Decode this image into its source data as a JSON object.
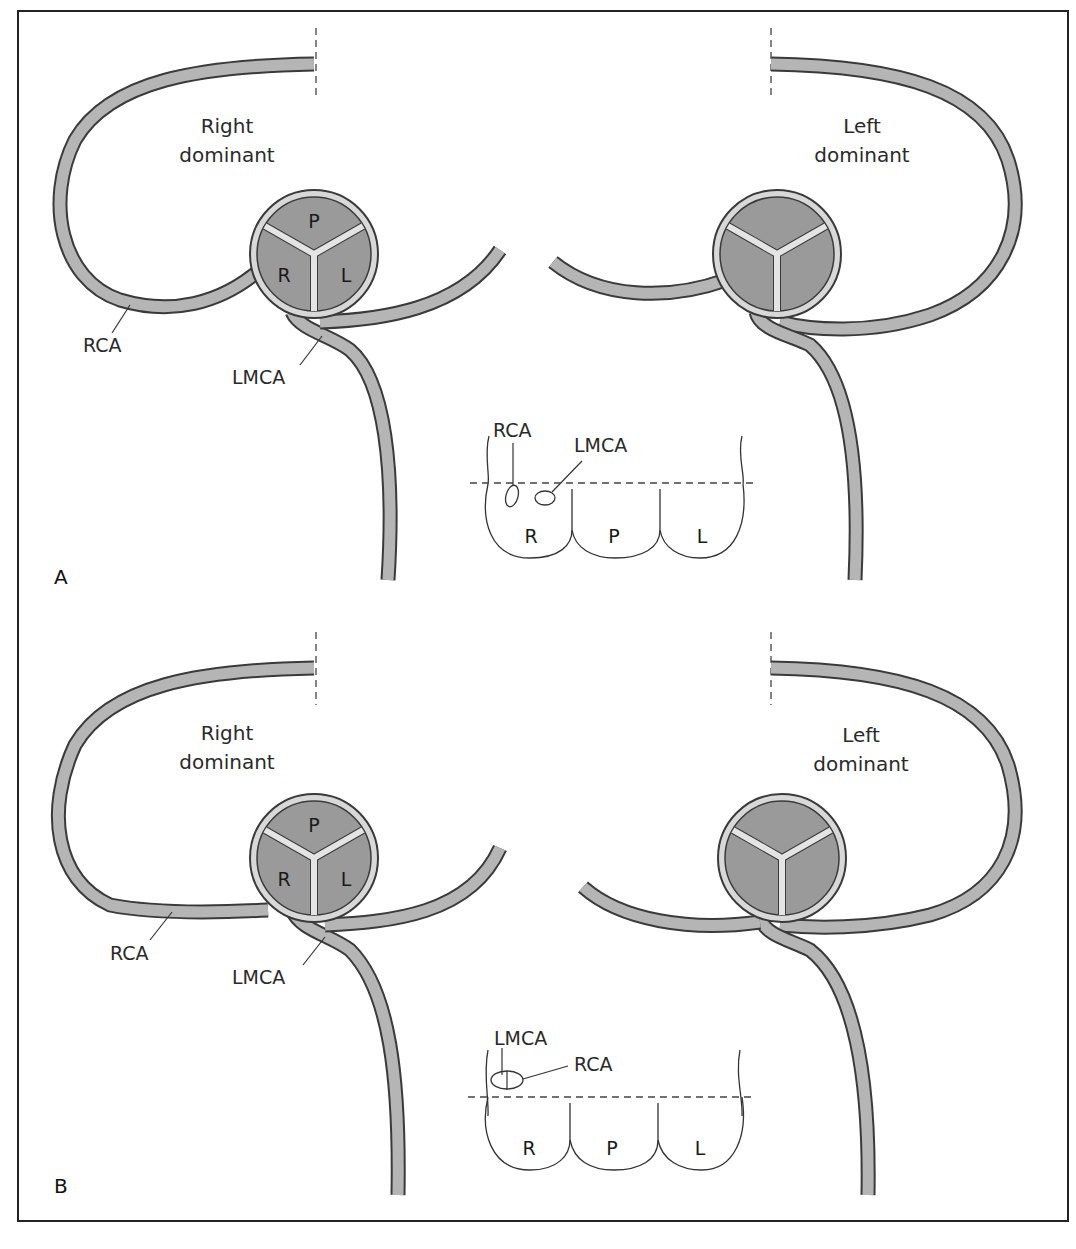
{
  "figure": {
    "panels": [
      {
        "label": "A",
        "right_diagram": {
          "title_line1": "Right",
          "title_line2": "dominant",
          "cusps": {
            "posterior": "P",
            "right": "R",
            "left": "L"
          },
          "labels": {
            "rca": "RCA",
            "lmca": "LMCA"
          }
        },
        "left_diagram": {
          "title_line1": "Left",
          "title_line2": "dominant"
        },
        "inset": {
          "label_rca": "RCA",
          "label_lmca": "LMCA",
          "sinus_labels": [
            "R",
            "P",
            "L"
          ]
        }
      },
      {
        "label": "B",
        "right_diagram": {
          "title_line1": "Right",
          "title_line2": "dominant",
          "cusps": {
            "posterior": "P",
            "right": "R",
            "left": "L"
          },
          "labels": {
            "rca": "RCA",
            "lmca": "LMCA"
          }
        },
        "left_diagram": {
          "title_line1": "Left",
          "title_line2": "dominant"
        },
        "inset": {
          "label_rca": "RCA",
          "label_lmca": "LMCA",
          "sinus_labels": [
            "R",
            "P",
            "L"
          ]
        }
      }
    ],
    "colors": {
      "vessel": "#b5b5b5",
      "cusp": "#9a9a9a",
      "outline": "#3a3a3a",
      "frame": "#222222"
    }
  }
}
